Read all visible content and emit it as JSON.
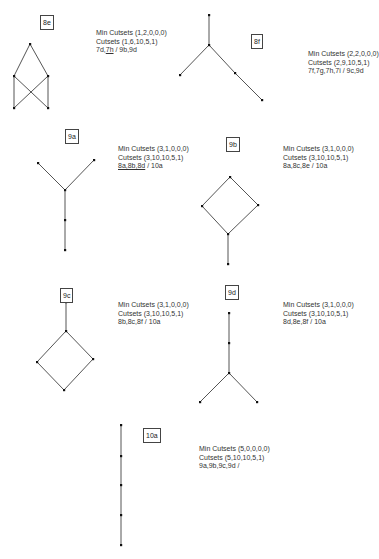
{
  "diagrams": [
    {
      "id": "8e",
      "label": "8e",
      "min_cutsets": "Min Cutsets (1,2,0,0,0)",
      "cutsets": "Cutsets (1,6,10,5,1)",
      "relations_prefix": "7d,",
      "relations_underlined": "7h",
      "relations_suffix": " / 9b,9d",
      "nodes": 5,
      "edges": [
        [
          0,
          1
        ],
        [
          0,
          2
        ],
        [
          1,
          3
        ],
        [
          2,
          4
        ],
        [
          1,
          4
        ],
        [
          2,
          3
        ]
      ]
    },
    {
      "id": "8f",
      "label": "8f",
      "min_cutsets": "Min Cutsets (2,2,0,0,0)",
      "cutsets": "Cutsets (2,9,10,5,1)",
      "relations": "7f,7g,7h,7i / 9c,9d",
      "nodes": 5,
      "edges": [
        [
          0,
          1
        ],
        [
          1,
          2
        ],
        [
          1,
          3
        ],
        [
          3,
          4
        ]
      ]
    },
    {
      "id": "9a",
      "label": "9a",
      "min_cutsets": "Min Cutsets (3,1,0,0,0)",
      "cutsets": "Cutsets (3,10,10,5,1)",
      "relations_underlined": "8a,8b,8d",
      "relations_suffix": " / 10a",
      "nodes": 5,
      "edges": [
        [
          0,
          2
        ],
        [
          1,
          2
        ],
        [
          2,
          3
        ],
        [
          3,
          4
        ]
      ]
    },
    {
      "id": "9b",
      "label": "9b",
      "min_cutsets": "Min Cutsets (3,1,0,0,0)",
      "cutsets": "Cutsets (3,10,10,5,1)",
      "relations": "8a,8c,8e / 10a",
      "nodes": 5,
      "edges": [
        [
          0,
          1
        ],
        [
          0,
          2
        ],
        [
          1,
          3
        ],
        [
          2,
          3
        ],
        [
          3,
          4
        ]
      ]
    },
    {
      "id": "9c",
      "label": "9c",
      "min_cutsets": "Min Cutsets (3,1,0,0,0)",
      "cutsets": "Cutsets (3,10,10,5,1)",
      "relations": "8b,8c,8f / 10a",
      "nodes": 5,
      "edges": [
        [
          0,
          1
        ],
        [
          1,
          2
        ],
        [
          1,
          3
        ],
        [
          2,
          4
        ],
        [
          3,
          4
        ]
      ]
    },
    {
      "id": "9d",
      "label": "9d",
      "min_cutsets": "Min Cutsets (3,1,0,0,0)",
      "cutsets": "Cutsets (3,10,10,5,1)",
      "relations": "8d,8e,8f / 10a",
      "nodes": 5,
      "edges": [
        [
          0,
          1
        ],
        [
          1,
          2
        ],
        [
          2,
          3
        ],
        [
          2,
          4
        ]
      ]
    },
    {
      "id": "10a",
      "label": "10a",
      "min_cutsets": "Min Cutsets (5,0,0,0,0)",
      "cutsets": "Cutsets (5,10,10,5,1)",
      "relations": "9a,9b,9c,9d /",
      "nodes": 5,
      "edges": [
        [
          0,
          1
        ],
        [
          1,
          2
        ],
        [
          2,
          3
        ],
        [
          3,
          4
        ]
      ]
    }
  ]
}
